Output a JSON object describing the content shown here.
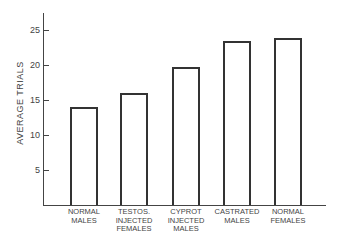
{
  "chart_data": {
    "type": "bar",
    "title": "",
    "xlabel": "",
    "ylabel": "AVERAGE TRIALS",
    "categories": [
      [
        "NORMAL",
        "MALES"
      ],
      [
        "TESTOS.",
        "INJECTED",
        "FEMALES"
      ],
      [
        "CYPROT",
        "INJECTED",
        "MALES"
      ],
      [
        "CASTRATED",
        "MALES"
      ],
      [
        "NORMAL",
        "FEMALES"
      ]
    ],
    "category_names": [
      "Normal Males",
      "Testos. Injected Females",
      "Cyprot Injected Males",
      "Castrated Males",
      "Normal Females"
    ],
    "values": [
      14.0,
      16.0,
      19.7,
      23.4,
      23.9
    ],
    "yticks": [
      5,
      10,
      15,
      20,
      25
    ],
    "ytick_labels": [
      "5",
      "10",
      "15",
      "20",
      "25"
    ],
    "ylim": [
      0,
      27
    ],
    "grid": false,
    "legend": null,
    "bar_fill": "#ffffff",
    "bar_stroke": "#333333"
  }
}
